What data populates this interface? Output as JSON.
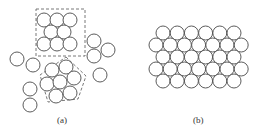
{
  "figure": {
    "panels": [
      {
        "id": "a",
        "label": "(a)",
        "description": "Disordered particles with locally ordered clusters",
        "circle_radius": 7,
        "square_cluster": {
          "box": {
            "x": 36,
            "y": 9,
            "w": 49,
            "h": 47
          },
          "circles": [
            [
              44,
              20
            ],
            [
              57,
              20
            ],
            [
              70,
              20
            ],
            [
              51,
              32
            ],
            [
              64,
              32
            ],
            [
              44,
              44
            ],
            [
              57,
              44
            ],
            [
              70,
              44
            ]
          ]
        },
        "pentagon_cluster": {
          "polygon": [
            [
              66,
              57
            ],
            [
              86,
              76
            ],
            [
              78,
              99
            ],
            [
              48,
              102
            ],
            [
              40,
              75
            ]
          ],
          "circles": [
            [
              52,
              70
            ],
            [
              66,
              67
            ],
            [
              47,
              84
            ],
            [
              60,
              82
            ],
            [
              74,
              78
            ],
            [
              56,
              96
            ],
            [
              70,
              93
            ]
          ]
        },
        "loose_circles": [
          [
            17,
            59
          ],
          [
            33,
            65
          ],
          [
            30,
            89
          ],
          [
            30,
            105
          ],
          [
            94,
            41
          ],
          [
            94,
            56
          ],
          [
            108,
            50
          ],
          [
            100,
            75
          ]
        ]
      },
      {
        "id": "b",
        "label": "(b)",
        "description": "Ordered hexagonal close-packed arrangement",
        "circle_radius": 7,
        "rows": [
          {
            "y": 33,
            "count": 6,
            "x_start": 163
          },
          {
            "y": 45,
            "count": 7,
            "x_start": 156
          },
          {
            "y": 57,
            "count": 6,
            "x_start": 163
          },
          {
            "y": 69,
            "count": 7,
            "x_start": 156
          },
          {
            "y": 81,
            "count": 6,
            "x_start": 163
          }
        ],
        "x_step": 14.2
      }
    ],
    "colors": {
      "stroke": "#4a4a4a",
      "dash": "#555555",
      "fill": "#ffffff"
    }
  }
}
